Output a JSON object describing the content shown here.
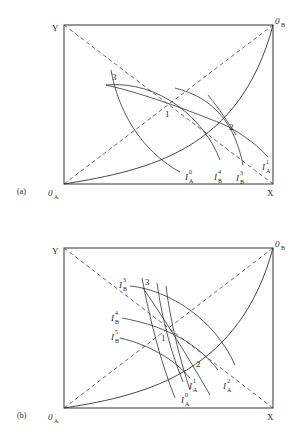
{
  "figure": {
    "panels": [
      {
        "id": "a",
        "tag": "(a)",
        "corners": {
          "top_left": "Y",
          "top_right": "0",
          "top_right_sub": "B",
          "bottom_left": "0",
          "bottom_left_sub": "A",
          "bottom_right": "X"
        },
        "points": [
          "1",
          "2",
          "3"
        ],
        "curve_labels": [
          {
            "base": "I",
            "sub": "A",
            "sup": "0"
          },
          {
            "base": "I",
            "sub": "B",
            "sup": "4"
          },
          {
            "base": "I",
            "sub": "B",
            "sup": "3"
          },
          {
            "base": "I",
            "sub": "A",
            "sup": "1"
          }
        ]
      },
      {
        "id": "b",
        "tag": "(b)",
        "corners": {
          "top_left": "Y",
          "top_right": "0",
          "top_right_sub": "B",
          "bottom_left": "0",
          "bottom_left_sub": "A",
          "bottom_right": "X"
        },
        "points": [
          "1",
          "2",
          "3"
        ],
        "curve_labels": [
          {
            "base": "I",
            "sub": "B",
            "sup": "3"
          },
          {
            "base": "I",
            "sub": "B",
            "sup": "4"
          },
          {
            "base": "I",
            "sub": "B",
            "sup": "5"
          },
          {
            "base": "I",
            "sub": "A",
            "sup": "1"
          },
          {
            "base": "I",
            "sub": "A",
            "sup": "0"
          },
          {
            "base": "I",
            "sub": "A",
            "sup": "2"
          }
        ]
      }
    ]
  }
}
